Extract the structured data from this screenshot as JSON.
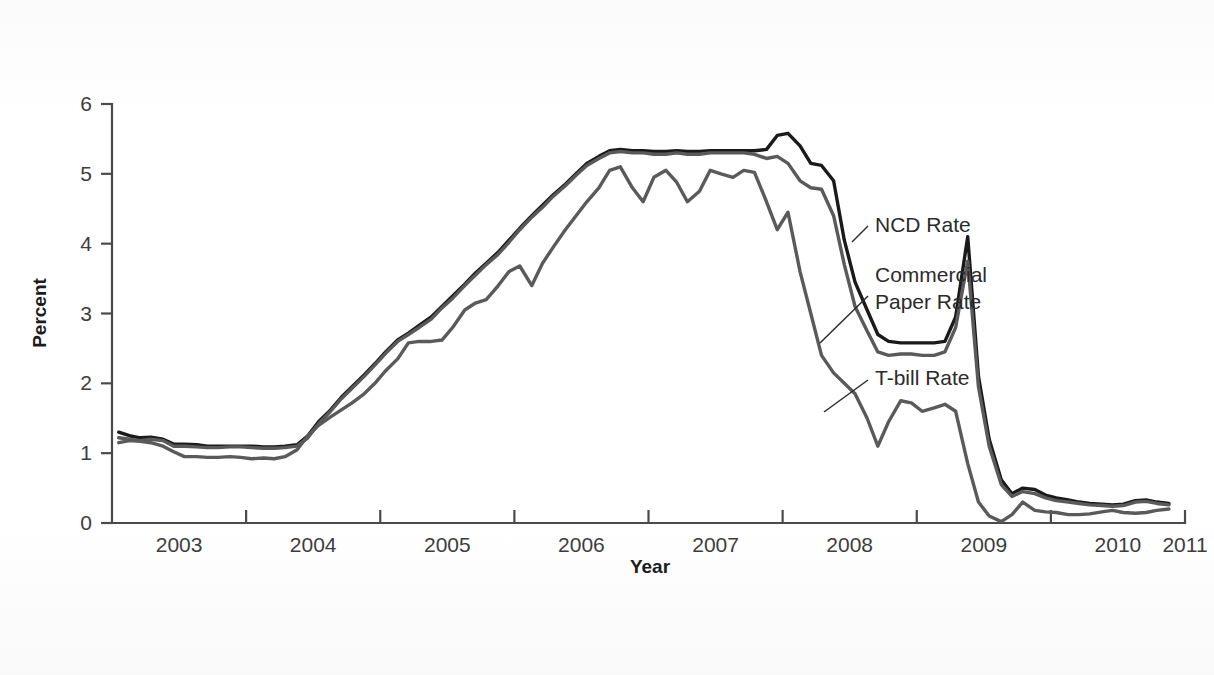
{
  "figure": {
    "background_color": "#ffffff",
    "plot_background_color": "#ffffff"
  },
  "chart_data": {
    "type": "line",
    "title": "",
    "subtitle": "",
    "xlabel": "Year",
    "ylabel": "Percent",
    "xlim": [
      2003.0,
      2011.0
    ],
    "ylim": [
      0,
      6
    ],
    "grid": false,
    "legend_position": "inline-annotations",
    "x_tick_labels": [
      "2003",
      "2004",
      "2005",
      "2006",
      "2007",
      "2008",
      "2009",
      "2010",
      "2011"
    ],
    "x_tick_values": [
      2003,
      2004,
      2005,
      2006,
      2007,
      2008,
      2009,
      2010,
      2011
    ],
    "y_tick_labels": [
      "0",
      "1",
      "2",
      "3",
      "4",
      "5",
      "6"
    ],
    "y_tick_values": [
      0,
      1,
      2,
      3,
      4,
      5,
      6
    ],
    "x": [
      2003.05,
      2003.13,
      2003.21,
      2003.29,
      2003.38,
      2003.46,
      2003.54,
      2003.63,
      2003.71,
      2003.79,
      2003.88,
      2003.96,
      2004.04,
      2004.13,
      2004.21,
      2004.29,
      2004.38,
      2004.46,
      2004.54,
      2004.63,
      2004.71,
      2004.79,
      2004.88,
      2004.96,
      2005.04,
      2005.13,
      2005.21,
      2005.29,
      2005.38,
      2005.46,
      2005.54,
      2005.63,
      2005.71,
      2005.79,
      2005.88,
      2005.96,
      2006.04,
      2006.13,
      2006.21,
      2006.29,
      2006.38,
      2006.46,
      2006.54,
      2006.63,
      2006.71,
      2006.79,
      2006.88,
      2006.96,
      2007.04,
      2007.13,
      2007.21,
      2007.29,
      2007.38,
      2007.46,
      2007.54,
      2007.63,
      2007.71,
      2007.79,
      2007.88,
      2007.96,
      2008.04,
      2008.13,
      2008.21,
      2008.29,
      2008.38,
      2008.46,
      2008.54,
      2008.63,
      2008.71,
      2008.79,
      2008.88,
      2008.96,
      2009.04,
      2009.13,
      2009.21,
      2009.29,
      2009.38,
      2009.46,
      2009.54,
      2009.63,
      2009.71,
      2009.79,
      2009.88,
      2009.96,
      2010.04,
      2010.13,
      2010.21,
      2010.29,
      2010.38,
      2010.46,
      2010.54,
      2010.63,
      2010.71,
      2010.79,
      2010.88
    ],
    "series": [
      {
        "name": "NCD Rate",
        "color": "#1a1a1a",
        "width": 3.4,
        "values": [
          1.3,
          1.25,
          1.22,
          1.23,
          1.2,
          1.13,
          1.13,
          1.12,
          1.1,
          1.1,
          1.1,
          1.1,
          1.1,
          1.09,
          1.09,
          1.1,
          1.12,
          1.25,
          1.45,
          1.62,
          1.8,
          1.95,
          2.12,
          2.28,
          2.45,
          2.62,
          2.72,
          2.83,
          2.95,
          3.1,
          3.25,
          3.42,
          3.58,
          3.72,
          3.88,
          4.05,
          4.22,
          4.4,
          4.55,
          4.7,
          4.85,
          5.0,
          5.15,
          5.25,
          5.33,
          5.35,
          5.33,
          5.33,
          5.32,
          5.32,
          5.33,
          5.32,
          5.32,
          5.33,
          5.33,
          5.33,
          5.33,
          5.33,
          5.35,
          5.55,
          5.58,
          5.4,
          5.15,
          5.12,
          4.9,
          4.05,
          3.45,
          3.05,
          2.7,
          2.6,
          2.58,
          2.58,
          2.58,
          2.58,
          2.6,
          2.95,
          4.1,
          2.1,
          1.2,
          0.62,
          0.42,
          0.5,
          0.48,
          0.4,
          0.36,
          0.33,
          0.3,
          0.28,
          0.27,
          0.26,
          0.27,
          0.32,
          0.33,
          0.3,
          0.28
        ]
      },
      {
        "name": "Commercial Paper Rate",
        "color": "#5a5a5a",
        "width": 3.4,
        "values": [
          1.22,
          1.2,
          1.18,
          1.2,
          1.18,
          1.1,
          1.1,
          1.09,
          1.08,
          1.08,
          1.09,
          1.09,
          1.08,
          1.07,
          1.07,
          1.08,
          1.1,
          1.22,
          1.42,
          1.6,
          1.78,
          1.93,
          2.1,
          2.26,
          2.43,
          2.6,
          2.7,
          2.8,
          2.92,
          3.08,
          3.22,
          3.4,
          3.55,
          3.7,
          3.85,
          4.02,
          4.2,
          4.38,
          4.52,
          4.68,
          4.83,
          4.98,
          5.12,
          5.22,
          5.3,
          5.32,
          5.3,
          5.3,
          5.28,
          5.28,
          5.3,
          5.28,
          5.28,
          5.3,
          5.3,
          5.3,
          5.3,
          5.28,
          5.22,
          5.25,
          5.15,
          4.9,
          4.8,
          4.78,
          4.4,
          3.7,
          3.1,
          2.75,
          2.45,
          2.4,
          2.42,
          2.42,
          2.4,
          2.4,
          2.45,
          2.8,
          3.75,
          1.95,
          1.1,
          0.55,
          0.38,
          0.45,
          0.42,
          0.36,
          0.32,
          0.3,
          0.28,
          0.26,
          0.25,
          0.24,
          0.25,
          0.3,
          0.31,
          0.28,
          0.26
        ]
      },
      {
        "name": "T-bill Rate",
        "color": "#5a5a5a",
        "width": 3.4,
        "values": [
          1.15,
          1.18,
          1.17,
          1.15,
          1.1,
          1.02,
          0.95,
          0.95,
          0.94,
          0.94,
          0.95,
          0.94,
          0.92,
          0.93,
          0.92,
          0.95,
          1.05,
          1.25,
          1.4,
          1.52,
          1.62,
          1.72,
          1.85,
          2.0,
          2.18,
          2.35,
          2.58,
          2.6,
          2.6,
          2.62,
          2.8,
          3.05,
          3.15,
          3.2,
          3.4,
          3.6,
          3.68,
          3.4,
          3.72,
          3.95,
          4.2,
          4.4,
          4.6,
          4.8,
          5.05,
          5.1,
          4.8,
          4.6,
          4.95,
          5.05,
          4.88,
          4.6,
          4.75,
          5.05,
          5.0,
          4.95,
          5.05,
          5.02,
          4.6,
          4.2,
          4.45,
          3.6,
          3.0,
          2.4,
          2.15,
          2.0,
          1.85,
          1.5,
          1.1,
          1.45,
          1.75,
          1.72,
          1.6,
          1.65,
          1.7,
          1.6,
          0.85,
          0.3,
          0.1,
          0.02,
          0.12,
          0.3,
          0.18,
          0.16,
          0.15,
          0.12,
          0.12,
          0.13,
          0.16,
          0.18,
          0.15,
          0.14,
          0.15,
          0.18,
          0.2
        ]
      }
    ],
    "annotations": [
      {
        "id": "ncd",
        "text": "NCD Rate",
        "lines": [
          "NCD Rate"
        ],
        "text_x": 875,
        "text_y": 232,
        "leader": [
          [
            868,
            226
          ],
          [
            852,
            242
          ]
        ]
      },
      {
        "id": "commercial-paper",
        "text": "Commercial Paper Rate",
        "lines": [
          "Commercial",
          "Paper Rate"
        ],
        "text_x": 875,
        "text_y": 282,
        "leader": [
          [
            868,
            296
          ],
          [
            820,
            343
          ]
        ]
      },
      {
        "id": "tbill",
        "text": "T-bill Rate",
        "lines": [
          "T-bill Rate"
        ],
        "text_x": 875,
        "text_y": 385,
        "leader": [
          [
            868,
            380
          ],
          [
            824,
            412
          ]
        ]
      }
    ]
  },
  "axes": {
    "y_axis_title": "Percent",
    "x_axis_title": "Year"
  }
}
